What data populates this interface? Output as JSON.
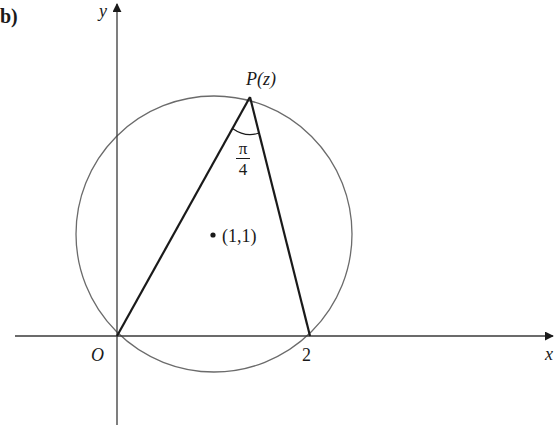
{
  "figure": {
    "part_label": "b)",
    "axes": {
      "x_label": "x",
      "y_label": "y",
      "origin_label": "O",
      "x_tick_label": "2"
    },
    "point_P": {
      "label": "P(z)"
    },
    "angle": {
      "numerator": "π",
      "denominator": "4",
      "value": "π/4"
    },
    "center": {
      "label": "(1,1)"
    },
    "colors": {
      "line": "#1a1a1a",
      "circle": "#6b6b6b",
      "background": "#ffffff"
    }
  },
  "geometry": {
    "description": "Circle centred at (1,1) passing through O(0,0) and (2,0); point P(z) on the circle; chords O–P and P–2 subtend angle π/4 at P",
    "circle_center": [
      1,
      1
    ],
    "circle_radius": "√2",
    "points": {
      "O": [
        0,
        0
      ],
      "A": [
        2,
        0
      ]
    }
  }
}
